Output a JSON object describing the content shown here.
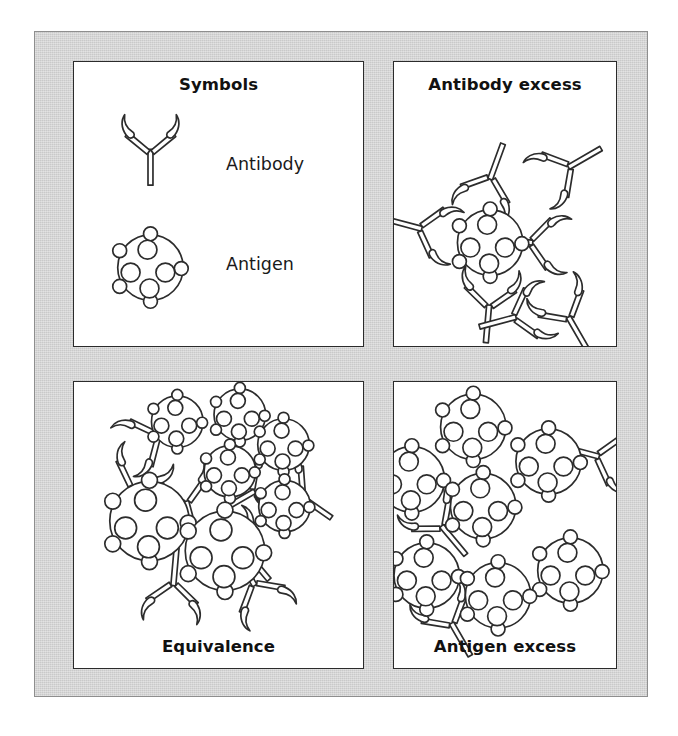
{
  "figure": {
    "kind": "scientific-diagram",
    "topic": "Antigen-antibody complex formation at different ratios",
    "background_color": "#c9c9c9",
    "panel_background_color": "#ffffff",
    "ink_color": "#2c2c2c"
  },
  "panels": {
    "symbols": {
      "title": "Symbols",
      "title_position": "top",
      "legend": [
        {
          "symbol": "antibody-icon",
          "label": "Antibody"
        },
        {
          "symbol": "antigen-icon",
          "label": "Antigen"
        }
      ]
    },
    "antibody_excess": {
      "title": "Antibody excess",
      "title_position": "top",
      "antigen_count": 1,
      "bound_antibody_count": 3,
      "free_antibody_count": 4,
      "description": "A single antigen saturated with antibodies; excess free antibodies remain unbound and no lattice forms."
    },
    "equivalence": {
      "title": "Equivalence",
      "title_position": "bottom",
      "antigen_count": 7,
      "bound_antibody_count": 8,
      "free_antibody_count": 0,
      "description": "Optimal antigen to antibody ratio produces a large cross-linked lattice that precipitates."
    },
    "antigen_excess": {
      "title": "Antigen excess",
      "title_position": "bottom",
      "antigen_count": 7,
      "bound_antibody_count": 3,
      "free_antibody_count": 0,
      "description": "Excess antigen leaves most antigen molecules free; only small soluble complexes form."
    }
  },
  "symbol_geometry": {
    "antibody": {
      "shape": "Y-shaped with two flared crescent arm tips and a single stem",
      "arm_tip": "crescent hook"
    },
    "antigen": {
      "shape": "circle with four interior epitope circles and small surface nubs",
      "epitope_count": 4,
      "surface_nub_count": 5
    }
  }
}
